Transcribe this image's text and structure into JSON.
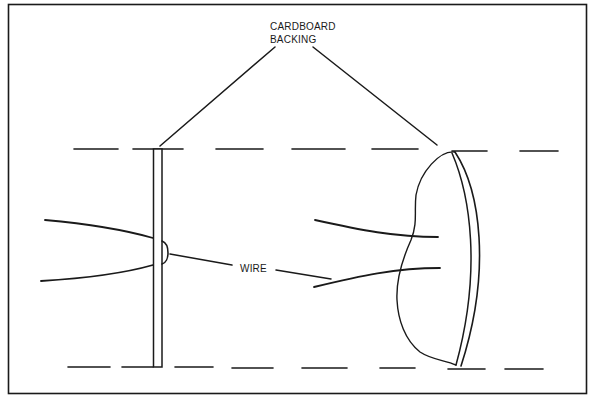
{
  "figure": {
    "type": "schematic line drawing",
    "labels": {
      "backing_line1": "CARDBOARD",
      "backing_line2": "BACKING",
      "wire": "WIRE"
    },
    "colors": {
      "ink": "#1a1a1a",
      "background": "#ffffff"
    }
  }
}
